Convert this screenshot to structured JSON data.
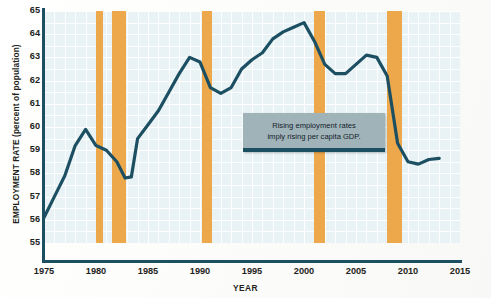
{
  "chart_data": {
    "type": "line",
    "title": "",
    "xlabel": "YEAR",
    "ylabel": "EMPLOYMENT RATE (percent of population)",
    "xlim": [
      1975,
      2015
    ],
    "ylim": [
      55,
      65
    ],
    "grid": true,
    "legend": "none",
    "line_color": "#1d4f63",
    "band_color": "#eda84c",
    "plot_bg": "#e9f3f5",
    "yticks": [
      "65",
      "64",
      "63",
      "62",
      "61",
      "60",
      "59",
      "58",
      "57",
      "56",
      "55"
    ],
    "xticks": [
      "1975",
      "1980",
      "1985",
      "1990",
      "1995",
      "2000",
      "2005",
      "2010",
      "2015"
    ],
    "series": [
      {
        "name": "Employment rate",
        "x": [
          1975.0,
          1976.0,
          1977.0,
          1978.0,
          1979.0,
          1980.0,
          1981.0,
          1982.0,
          1982.8,
          1983.4,
          1984.0,
          1985.0,
          1986.0,
          1987.0,
          1988.0,
          1989.0,
          1990.0,
          1991.0,
          1992.0,
          1993.0,
          1994.0,
          1995.0,
          1996.0,
          1997.0,
          1998.0,
          1999.0,
          2000.0,
          2001.0,
          2002.0,
          2003.0,
          2004.0,
          2005.0,
          2006.0,
          2007.0,
          2008.0,
          2009.0,
          2010.0,
          2011.0,
          2012.0,
          2013.0
        ],
        "y": [
          56.1,
          57.0,
          57.9,
          59.2,
          59.9,
          59.2,
          59.0,
          58.5,
          57.8,
          57.85,
          59.5,
          60.1,
          60.7,
          61.5,
          62.3,
          63.0,
          62.8,
          61.7,
          61.45,
          61.7,
          62.5,
          62.9,
          63.2,
          63.8,
          64.1,
          64.3,
          64.5,
          63.7,
          62.7,
          62.3,
          62.3,
          62.7,
          63.1,
          63.0,
          62.2,
          59.3,
          58.5,
          58.4,
          58.6,
          58.65
        ]
      }
    ],
    "recession_bands": [
      {
        "start": 1980.0,
        "end": 1980.7
      },
      {
        "start": 1981.5,
        "end": 1982.9
      },
      {
        "start": 1990.2,
        "end": 1991.2
      },
      {
        "start": 2001.0,
        "end": 2002.0
      },
      {
        "start": 2008.0,
        "end": 2009.4
      }
    ],
    "annotations": [
      {
        "name": "callout",
        "line1": "Rising employment rates",
        "line2": "imply rising per capita GDP."
      }
    ]
  }
}
